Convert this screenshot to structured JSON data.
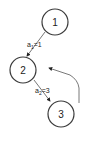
{
  "diagram": {
    "nodes": [
      {
        "id": "1",
        "label": "1"
      },
      {
        "id": "2",
        "label": "2"
      },
      {
        "id": "3",
        "label": "3"
      }
    ],
    "edges": [
      {
        "from": "1",
        "to": "2",
        "label_var": "a",
        "label_sub": "1",
        "label_val": "=1"
      },
      {
        "from": "2",
        "to": "3",
        "label_var": "a",
        "label_sub": "2",
        "label_val": "=3"
      },
      {
        "from": "3",
        "to": "2",
        "label_var": "",
        "label_sub": "",
        "label_val": "",
        "style": "curved"
      }
    ],
    "colors": {
      "stroke": "#3a3a3a",
      "edge": "#555555",
      "text": "#222222",
      "background": "#ffffff"
    }
  }
}
